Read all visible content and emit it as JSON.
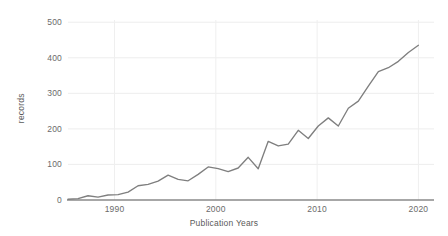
{
  "chart_data": {
    "type": "line",
    "title": "",
    "xlabel": "Publication Years",
    "ylabel": "records",
    "xlim": [
      1985,
      2020
    ],
    "ylim": [
      0,
      500
    ],
    "grid": true,
    "legend": false,
    "line_color": "#7f7f7f",
    "grid_color": "#ededed",
    "axis_color": "#808080",
    "background": "#ffffff",
    "xticks": [
      "1990",
      "2000",
      "2010",
      "2020"
    ],
    "xtick_values": [
      1990,
      2000,
      2010,
      2020
    ],
    "yticks": [
      "0",
      "100",
      "200",
      "300",
      "400",
      "500"
    ],
    "ytick_values": [
      0,
      100,
      200,
      300,
      400,
      500
    ],
    "x": [
      1985,
      1986,
      1987,
      1988,
      1989,
      1990,
      1991,
      1992,
      1993,
      1994,
      1995,
      1996,
      1997,
      1998,
      1999,
      2000,
      2001,
      2002,
      2003,
      2004,
      2005,
      2006,
      2007,
      2008,
      2009,
      2010,
      2011,
      2012,
      2013,
      2014,
      2015,
      2016,
      2017,
      2018,
      2019,
      2020
    ],
    "values": [
      2,
      4,
      12,
      8,
      14,
      15,
      22,
      40,
      44,
      53,
      70,
      58,
      54,
      72,
      93,
      88,
      80,
      90,
      120,
      88,
      165,
      152,
      157,
      196,
      173,
      208,
      231,
      208,
      258,
      278,
      320,
      361,
      372,
      390,
      415,
      435
    ],
    "series": [
      {
        "name": "records",
        "values": [
          2,
          4,
          12,
          8,
          14,
          15,
          22,
          40,
          44,
          53,
          70,
          58,
          54,
          72,
          93,
          88,
          80,
          90,
          120,
          88,
          165,
          152,
          157,
          196,
          173,
          208,
          231,
          208,
          258,
          278,
          320,
          361,
          372,
          390,
          415,
          435
        ]
      }
    ]
  },
  "axes": {
    "y_labels": [
      "500",
      "400",
      "300",
      "200",
      "100",
      "0"
    ],
    "x_labels": [
      "1990",
      "2000",
      "2010",
      "2020"
    ],
    "x_title": "Publication Years",
    "y_title": "records"
  }
}
